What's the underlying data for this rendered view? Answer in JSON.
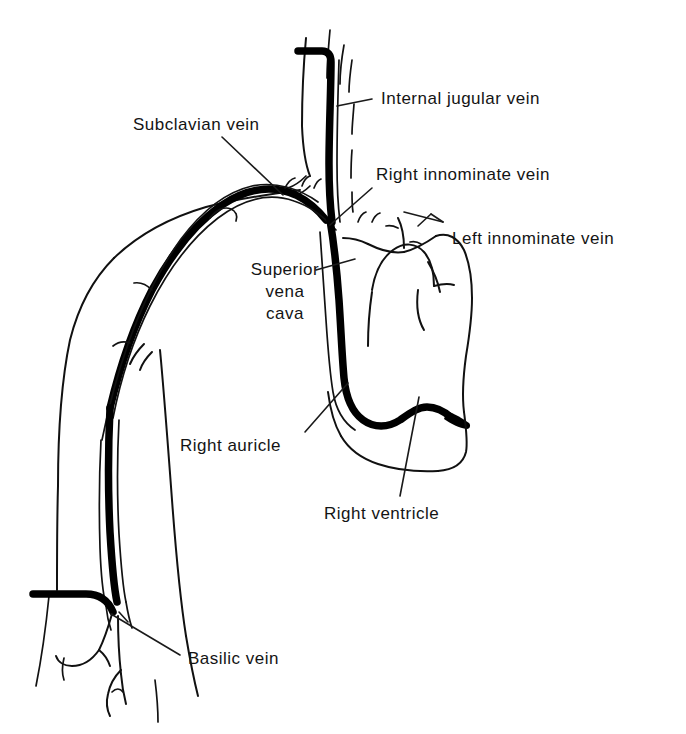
{
  "figure": {
    "kind": "anatomical-line-drawing",
    "background_color": "#ffffff",
    "ink_color": "#111111"
  },
  "labels": [
    {
      "id": "internal-jugular-vein",
      "text": "Internal jugular vein",
      "left": 381,
      "top": 88,
      "leader": "M 337,106 L 372,99"
    },
    {
      "id": "subclavian-vein",
      "text": "Subclavian vein",
      "left": 133,
      "top": 114,
      "leader": "M 222,137 L 283,195"
    },
    {
      "id": "right-innominate-vein",
      "text": "Right innominate vein",
      "left": 376,
      "top": 164,
      "leader": "M 372,188 L 330,225"
    },
    {
      "id": "left-innominate-vein",
      "text": "Left innominate vein",
      "left": 452,
      "top": 228,
      "leader": "M 443,222 L 404,212"
    },
    {
      "id": "superior-vena-cava",
      "lines": [
        "Superior",
        "vena",
        "cava"
      ],
      "left": 225,
      "top": 259,
      "width": 120,
      "leader": "M 316,270 L 355,259"
    },
    {
      "id": "right-auricle",
      "text": "Right auricle",
      "left": 180,
      "top": 435,
      "leader": "M 305,432 L 348,383"
    },
    {
      "id": "right-ventricle",
      "text": "Right ventricle",
      "left": 324,
      "top": 503,
      "leader": "M 400,496 L 419,397"
    },
    {
      "id": "basilic-vein",
      "text": "Basilic vein",
      "left": 188,
      "top": 648,
      "leader": "M 180,655 L 111,614"
    }
  ],
  "structures": [
    {
      "id": "neck-outline",
      "description": "thin contour of the neck and jaw line"
    },
    {
      "id": "internal-jugular-vein-vessel",
      "description": "thick vertical vein descending through the neck"
    },
    {
      "id": "clavicle-shoulder-contour",
      "description": "thin contour of shoulder and upper chest"
    },
    {
      "id": "subclavian-vein-vessel",
      "description": "thick arcing vein over the shoulder"
    },
    {
      "id": "superior-vena-cava-vessel",
      "description": "thick vein descending into the heart"
    },
    {
      "id": "heart-outline",
      "description": "thin closed silhouette of the heart"
    },
    {
      "id": "aortic-arch",
      "description": "thin curve of aortic arch above the heart"
    },
    {
      "id": "pulmonary-trunk",
      "description": "thin curve right of the aortic arch"
    },
    {
      "id": "right-auricle-tip",
      "description": "thick catheter tip resting in the right auricle"
    },
    {
      "id": "arm-outline",
      "description": "thin contour of the upper arm"
    },
    {
      "id": "basilic-vein-vessel",
      "description": "thick vein running the length of the arm"
    },
    {
      "id": "tourniquet-band",
      "description": "thick horizontal band across the lower arm"
    },
    {
      "id": "antecubital-tributaries",
      "description": "thin forked venous tributaries below the band"
    }
  ]
}
